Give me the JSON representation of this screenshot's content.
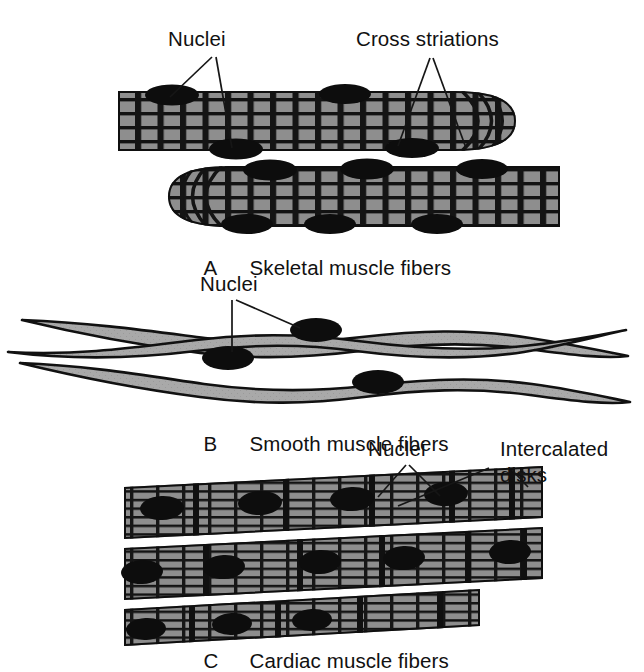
{
  "figure": {
    "type": "biology-illustration",
    "background_color": "#ffffff",
    "ink_color": "#111111",
    "fill_gray": "#8e8e8e",
    "smooth_fill_gray": "#a9a9a9",
    "nucleus_color": "#0d0d0d"
  },
  "labels": {
    "skeletal_nuclei": "Nuclei",
    "cross_striations": "Cross striations",
    "smooth_nuclei": "Nuclei",
    "cardiac_nuclei": "Nuclei",
    "intercalated_disks_line1": "Intercalated",
    "intercalated_disks_line2": "disks"
  },
  "captions": [
    {
      "letter": "A",
      "text": "Skeletal muscle fibers"
    },
    {
      "letter": "B",
      "text": "Smooth muscle fibers"
    },
    {
      "letter": "C",
      "text": "Cardiac muscle fibers"
    }
  ],
  "panels": {
    "a": {
      "letter": "A",
      "title": "Skeletal muscle fibers",
      "fiber_count": 2,
      "nuclei_position": "peripheral",
      "striations": "cross striations",
      "branching": "none"
    },
    "b": {
      "letter": "B",
      "title": "Smooth muscle fibers",
      "fiber_count": 3,
      "nuclei_position": "central, one per fiber",
      "striations": "none",
      "shape": "spindle / fusiform with tapered ends"
    },
    "c": {
      "letter": "C",
      "title": "Cardiac muscle fibers",
      "fiber_count": 3,
      "nuclei_position": "central",
      "striations": "cross striations",
      "special_feature": "intercalated disks"
    }
  }
}
